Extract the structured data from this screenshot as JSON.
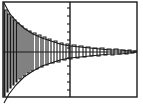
{
  "chart_data": {
    "type": "line",
    "title": "",
    "subtitle": "",
    "xlabel": "",
    "ylabel": "",
    "xlim": [
      0,
      143
    ],
    "ylim": [
      -1.15,
      1.15
    ],
    "grid": false,
    "legend": null,
    "legend_position": "none",
    "annotations": [],
    "axes_frame": {
      "left": 3,
      "top": 2,
      "right": 137,
      "bottom": 97,
      "line_color": "#1a1a1a",
      "line_width": 1.4
    },
    "zero_axis": {
      "orientation": "horizontal",
      "y_pixel": 52,
      "x_start": 3,
      "x_end": 137,
      "line_color": "#1a1a1a",
      "line_width": 1.2
    },
    "vertical_axis": {
      "orientation": "vertical",
      "x_pixel": 70,
      "y_start": 2,
      "y_end": 97,
      "line_color": "#1a1a1a",
      "line_width": 1.4,
      "tick_side": "left",
      "tick_length": 3,
      "tick_y_pixels": [
        8,
        16,
        24,
        32,
        40,
        48,
        58,
        66,
        74,
        82,
        90
      ]
    },
    "series": [
      {
        "name": "damped-oscillation",
        "color": "#1a1a1a",
        "line_width": 1.1,
        "points": [
          [
            4,
            2
          ],
          [
            4,
            96
          ],
          [
            5,
            96
          ],
          [
            5,
            10
          ],
          [
            7,
            10
          ],
          [
            7,
            92
          ],
          [
            8,
            92
          ],
          [
            8,
            14
          ],
          [
            10,
            14
          ],
          [
            10,
            88
          ],
          [
            11,
            88
          ],
          [
            11,
            17
          ],
          [
            13,
            17
          ],
          [
            13,
            85
          ],
          [
            14,
            85
          ],
          [
            14,
            20
          ],
          [
            16,
            20
          ],
          [
            16,
            82
          ],
          [
            17,
            82
          ],
          [
            17,
            23
          ],
          [
            19,
            23
          ],
          [
            19,
            79
          ],
          [
            21,
            79
          ],
          [
            21,
            26
          ],
          [
            23,
            26
          ],
          [
            23,
            76
          ],
          [
            25,
            76
          ],
          [
            25,
            29
          ],
          [
            27,
            29
          ],
          [
            27,
            73
          ],
          [
            29,
            73
          ],
          [
            29,
            31
          ],
          [
            31,
            31
          ],
          [
            31,
            71
          ],
          [
            33,
            71
          ],
          [
            33,
            33
          ],
          [
            36,
            33
          ],
          [
            36,
            69
          ],
          [
            38,
            69
          ],
          [
            38,
            35
          ],
          [
            41,
            35
          ],
          [
            41,
            67
          ],
          [
            43,
            67
          ],
          [
            43,
            37
          ],
          [
            46,
            37
          ],
          [
            46,
            65
          ],
          [
            48,
            65
          ],
          [
            48,
            39
          ],
          [
            51,
            39
          ],
          [
            51,
            63
          ],
          [
            54,
            63
          ],
          [
            54,
            41
          ],
          [
            57,
            41
          ],
          [
            57,
            62
          ],
          [
            60,
            62
          ],
          [
            60,
            43
          ],
          [
            63,
            43
          ],
          [
            63,
            60
          ],
          [
            66,
            60
          ],
          [
            66,
            44
          ],
          [
            69,
            44
          ],
          [
            69,
            59
          ],
          [
            72,
            59
          ],
          [
            72,
            45
          ],
          [
            76,
            45
          ],
          [
            76,
            58
          ],
          [
            79,
            58
          ],
          [
            79,
            46
          ],
          [
            83,
            46
          ],
          [
            83,
            57
          ],
          [
            86,
            57
          ],
          [
            86,
            47
          ],
          [
            90,
            47
          ],
          [
            90,
            56
          ],
          [
            93,
            56
          ],
          [
            93,
            48
          ],
          [
            97,
            48
          ],
          [
            97,
            56
          ],
          [
            100,
            56
          ],
          [
            100,
            48
          ],
          [
            104,
            48
          ],
          [
            104,
            55
          ],
          [
            107,
            55
          ],
          [
            107,
            49
          ],
          [
            111,
            49
          ],
          [
            111,
            55
          ],
          [
            114,
            55
          ],
          [
            114,
            49
          ],
          [
            118,
            49
          ],
          [
            118,
            54
          ],
          [
            121,
            54
          ],
          [
            121,
            50
          ],
          [
            125,
            50
          ],
          [
            125,
            54
          ],
          [
            128,
            54
          ],
          [
            128,
            50
          ],
          [
            131,
            50
          ],
          [
            131,
            53
          ],
          [
            134,
            53
          ],
          [
            134,
            51
          ],
          [
            137,
            51
          ]
        ]
      }
    ],
    "envelopes": [
      {
        "name": "upper-envelope",
        "color": "#1a1a1a",
        "line_width": 1.1,
        "points": [
          [
            4,
            3
          ],
          [
            10,
            14
          ],
          [
            17,
            22
          ],
          [
            25,
            29
          ],
          [
            33,
            34
          ],
          [
            42,
            38
          ],
          [
            51,
            41
          ],
          [
            60,
            44
          ],
          [
            70,
            46
          ],
          [
            80,
            47
          ],
          [
            90,
            48
          ],
          [
            100,
            49
          ],
          [
            110,
            50
          ],
          [
            120,
            50
          ],
          [
            130,
            51
          ],
          [
            137,
            51
          ]
        ]
      },
      {
        "name": "lower-envelope",
        "color": "#1a1a1a",
        "line_width": 1.1,
        "points": [
          [
            4,
            103
          ],
          [
            9,
            94
          ],
          [
            16,
            85
          ],
          [
            24,
            77
          ],
          [
            33,
            71
          ],
          [
            42,
            66
          ],
          [
            51,
            63
          ],
          [
            60,
            60
          ],
          [
            70,
            58
          ],
          [
            80,
            57
          ],
          [
            90,
            56
          ],
          [
            100,
            55
          ],
          [
            110,
            54
          ],
          [
            120,
            54
          ],
          [
            130,
            53
          ],
          [
            137,
            52
          ]
        ]
      }
    ],
    "colors": {
      "background": "#ffffff",
      "foreground": "#1a1a1a",
      "frame": "#1a1a1a"
    }
  },
  "figure": {
    "name": "damped-oscillation-figure",
    "width_px": 143,
    "height_px": 110,
    "caption": ""
  }
}
